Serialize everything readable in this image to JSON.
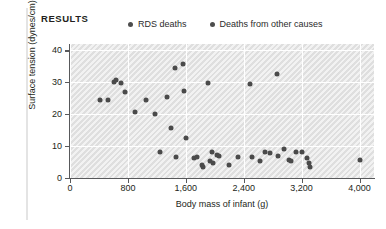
{
  "figure": {
    "section_label": "RESULTS"
  },
  "legend": {
    "position": "top",
    "items": [
      {
        "label": "RDS deaths",
        "marker": "filled-circle",
        "color": "#4d4d4d"
      },
      {
        "label": "Deaths from other causes",
        "marker": "filled-circle",
        "color": "#4d4d4d"
      }
    ]
  },
  "chart_data": {
    "type": "scatter",
    "title": "",
    "subtitle": "",
    "xlabel": "Body mass of infant (g)",
    "ylabel": "Surface tension (dynes/cm)",
    "xlim": [
      0,
      4200
    ],
    "ylim": [
      0,
      42
    ],
    "xticks": [
      0,
      800,
      1600,
      2400,
      3200,
      4000
    ],
    "xtick_labels": [
      "0",
      "800",
      "1,600",
      "2,400",
      "3,200",
      "4,000"
    ],
    "yticks": [
      0,
      10,
      20,
      30,
      40
    ],
    "ytick_labels": [
      "0",
      "10",
      "20",
      "30",
      "40"
    ],
    "grid": true,
    "grid_color": "#ffffff",
    "plot_background": "#e9e9e9",
    "marker_color": "#4a4a4a",
    "series": [
      {
        "name": "All deaths",
        "points": [
          [
            420,
            24.3
          ],
          [
            520,
            24.4
          ],
          [
            610,
            30.2
          ],
          [
            640,
            30.6
          ],
          [
            700,
            29.8
          ],
          [
            760,
            27.0
          ],
          [
            900,
            20.8
          ],
          [
            1050,
            24.5
          ],
          [
            1180,
            20.2
          ],
          [
            1250,
            8.2
          ],
          [
            1340,
            25.5
          ],
          [
            1400,
            15.6
          ],
          [
            1450,
            34.6
          ],
          [
            1460,
            6.6
          ],
          [
            1560,
            35.8
          ],
          [
            1570,
            27.4
          ],
          [
            1600,
            12.6
          ],
          [
            1720,
            6.3
          ],
          [
            1760,
            6.6
          ],
          [
            1820,
            4.0
          ],
          [
            1840,
            3.6
          ],
          [
            1900,
            29.9
          ],
          [
            1930,
            5.4
          ],
          [
            1960,
            8.1
          ],
          [
            1980,
            4.6
          ],
          [
            2030,
            7.2
          ],
          [
            2060,
            7.0
          ],
          [
            2200,
            4.1
          ],
          [
            2320,
            6.6
          ],
          [
            2480,
            29.6
          ],
          [
            2520,
            6.6
          ],
          [
            2620,
            5.4
          ],
          [
            2700,
            8.0
          ],
          [
            2760,
            7.9
          ],
          [
            2860,
            32.7
          ],
          [
            2880,
            6.9
          ],
          [
            2960,
            9.0
          ],
          [
            3020,
            5.6
          ],
          [
            3060,
            5.4
          ],
          [
            3120,
            8.3
          ],
          [
            3200,
            8.2
          ],
          [
            3280,
            6.3
          ],
          [
            3300,
            4.6
          ],
          [
            3320,
            3.4
          ],
          [
            4000,
            5.5
          ]
        ]
      }
    ]
  }
}
